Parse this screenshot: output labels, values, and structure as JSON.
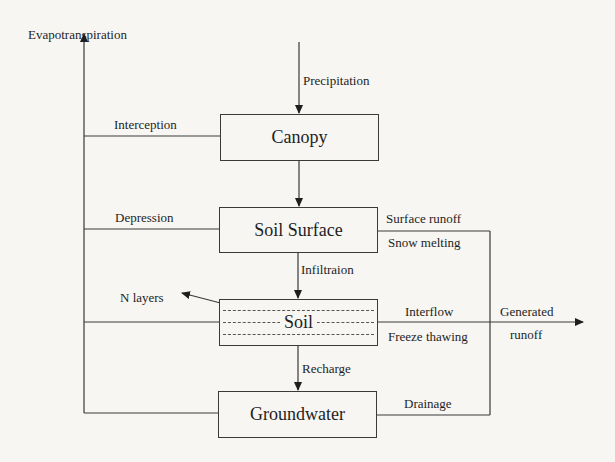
{
  "diagram": {
    "type": "flowchart",
    "nodes": {
      "canopy": "Canopy",
      "soil_surface": "Soil Surface",
      "soil": "Soil",
      "groundwater": "Groundwater"
    },
    "flows": {
      "evapotranspiration": "Evapotranspiration",
      "precipitation": "Precipitation",
      "interception": "Interception",
      "depression": "Depression",
      "surface_runoff": "Surface runoff",
      "snow_melting": "Snow melting",
      "infiltration": "Infiltraion",
      "n_layers": "N layers",
      "interflow": "Interflow",
      "freeze_thawing": "Freeze thawing",
      "generated_runoff_line1": "Generated",
      "generated_runoff_line2": "runoff",
      "recharge": "Recharge",
      "drainage": "Drainage"
    },
    "edges": [
      {
        "from": "Precipitation",
        "to": "Canopy"
      },
      {
        "from": "Canopy",
        "to": "Soil Surface"
      },
      {
        "from": "Soil Surface",
        "to": "Soil",
        "label": "Infiltraion"
      },
      {
        "from": "Soil",
        "to": "Groundwater",
        "label": "Recharge"
      },
      {
        "from": "Canopy",
        "to": "Evapotranspiration",
        "label": "Interception"
      },
      {
        "from": "Soil Surface",
        "to": "Evapotranspiration",
        "label": "Depression"
      },
      {
        "from": "Soil",
        "to": "Evapotranspiration"
      },
      {
        "from": "Groundwater",
        "to": "Evapotranspiration"
      },
      {
        "from": "Soil Surface",
        "to": "Generated runoff",
        "label": "Surface runoff / Snow melting"
      },
      {
        "from": "Soil",
        "to": "Generated runoff",
        "label": "Interflow / Freeze thawing"
      },
      {
        "from": "Groundwater",
        "to": "Generated runoff",
        "label": "Drainage"
      },
      {
        "from": "Soil",
        "to": "N layers"
      }
    ]
  }
}
